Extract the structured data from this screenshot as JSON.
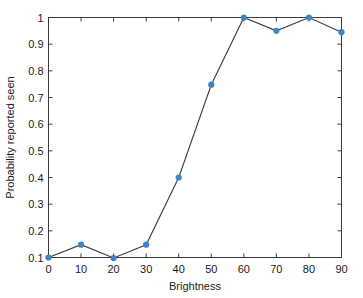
{
  "chart_data": {
    "type": "line",
    "title": "",
    "xlabel": "Brightness",
    "ylabel": "Probability reported seen",
    "x": [
      0,
      10,
      20,
      30,
      40,
      50,
      60,
      70,
      80,
      90
    ],
    "values": [
      0.1,
      0.148,
      0.098,
      0.148,
      0.4,
      0.748,
      1.0,
      0.95,
      1.0,
      0.945
    ],
    "series": [
      {
        "name": "Probability reported seen",
        "values": [
          0.1,
          0.148,
          0.098,
          0.148,
          0.4,
          0.748,
          1.0,
          0.95,
          1.0,
          0.945
        ]
      }
    ],
    "xlim": [
      0,
      90
    ],
    "ylim": [
      0.1,
      1
    ],
    "xticks": [
      0,
      10,
      20,
      30,
      40,
      50,
      60,
      70,
      80,
      90
    ],
    "xticklabels": [
      "0",
      "10",
      "20",
      "30",
      "40",
      "50",
      "60",
      "70",
      "80",
      "90"
    ],
    "yticks": [
      0.1,
      0.2,
      0.3,
      0.4,
      0.5,
      0.6,
      0.7,
      0.8,
      0.9,
      1
    ],
    "yticklabels": [
      "0.1",
      "0.2",
      "0.3",
      "0.4",
      "0.5",
      "0.6",
      "0.7",
      "0.8",
      "0.9",
      "1"
    ],
    "grid": false,
    "legend": null,
    "legend_position": "none",
    "marker": "circle",
    "marker_color": "#3d85c6",
    "line_color": "#3b3b3b",
    "axis_color": "#3b3b3b",
    "background_color": "#ffffff",
    "box": true,
    "tick_direction": "in"
  }
}
